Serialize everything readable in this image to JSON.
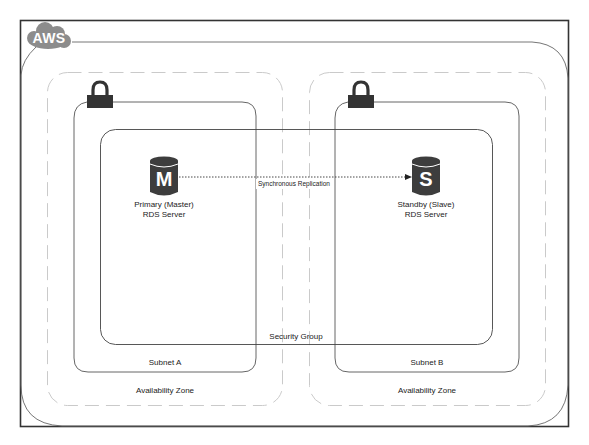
{
  "diagram": {
    "cloud": {
      "label": "AWS",
      "icon": "aws-cloud-icon",
      "color": "#8c8c8c"
    },
    "availability_zones": [
      {
        "label": "Availability Zone",
        "border": "dashed",
        "color": "#bfbfbf"
      },
      {
        "label": "Availability Zone",
        "border": "dashed",
        "color": "#bfbfbf"
      }
    ],
    "subnets": [
      {
        "label": "Subnet A",
        "icon": "lock-icon"
      },
      {
        "label": "Subnet B",
        "icon": "lock-icon"
      }
    ],
    "security_group": {
      "label": "Security Group"
    },
    "servers": [
      {
        "letter": "M",
        "line1": "Primary (Master)",
        "line2": "RDS Server",
        "icon": "database-icon",
        "color": "#3d3d3d"
      },
      {
        "letter": "S",
        "line1": "Standby (Slave)",
        "line2": "RDS Server",
        "icon": "database-icon",
        "color": "#3d3d3d"
      }
    ],
    "connection": {
      "label": "Synchronous Replication",
      "style": "dotted-arrow",
      "from": "M",
      "to": "S"
    },
    "colors": {
      "frame": "#333333",
      "region_line": "#666666",
      "az_dash": "#c4c4c4",
      "subnet_line": "#555555",
      "icon_dark": "#333333"
    }
  }
}
